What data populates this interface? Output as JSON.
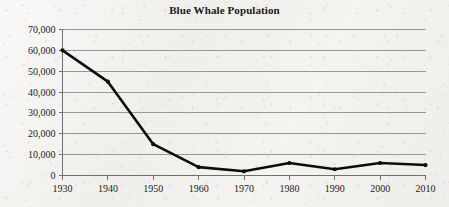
{
  "chart_data": {
    "type": "line",
    "title": "Blue Whale Population",
    "xlabel": "",
    "ylabel": "",
    "categories": [
      "1930",
      "1940",
      "1950",
      "1960",
      "1970",
      "1980",
      "1990",
      "2000",
      "2010"
    ],
    "x": [
      1930,
      1940,
      1950,
      1960,
      1970,
      1980,
      1990,
      2000,
      2010
    ],
    "values": [
      60000,
      45000,
      15000,
      4000,
      2000,
      6000,
      3000,
      6000,
      5000
    ],
    "series": [
      {
        "name": "Blue Whale Population",
        "values": [
          60000,
          45000,
          15000,
          4000,
          2000,
          6000,
          3000,
          6000,
          5000
        ]
      }
    ],
    "xlim": [
      1930,
      2010
    ],
    "ylim": [
      0,
      70000
    ],
    "ytick_labels": [
      "0",
      "10,000",
      "20,000",
      "30,000",
      "40,000",
      "50,000",
      "60,000",
      "70,000"
    ],
    "ytick_values": [
      0,
      10000,
      20000,
      30000,
      40000,
      50000,
      60000,
      70000
    ],
    "xtick_labels": [
      "1930",
      "1940",
      "1950",
      "1960",
      "1970",
      "1980",
      "1990",
      "2000",
      "2010"
    ],
    "grid": "horizontal",
    "legend": "none",
    "line_color": "#0d0d0d",
    "grid_color": "#8d8d8d",
    "axis_color": "#6f6f6f",
    "marker": "circle"
  }
}
